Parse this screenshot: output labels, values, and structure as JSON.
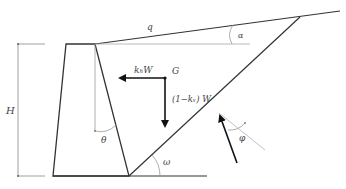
{
  "diagram": {
    "labels": {
      "surcharge": "q",
      "backfill_slope_angle": "α",
      "height": "H",
      "horizontal_inertia": "kₕW",
      "centroid": "G",
      "vertical_weight": "(1−kᵥ) W",
      "wall_back_angle": "θ",
      "failure_plane_angle": "ω",
      "friction_angle": "φ"
    },
    "colors": {
      "line": "#333333",
      "thin_line": "#888888",
      "light_line": "#bbbbbb",
      "arrow": "#111111",
      "text": "#444444"
    }
  }
}
